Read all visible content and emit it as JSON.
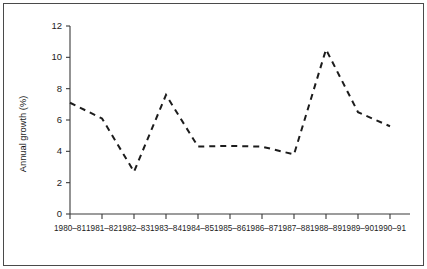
{
  "chart_data": {
    "type": "line",
    "title": "",
    "subtitle": "",
    "xlabel": "",
    "ylabel": "Annual growth (%)",
    "categories": [
      "1980–81",
      "1981–82",
      "1982–83",
      "1983–84",
      "1984–85",
      "1985–86",
      "1986–87",
      "1987–88",
      "1988–89",
      "1989–90",
      "1990–91"
    ],
    "values": [
      7.1,
      6.1,
      2.7,
      7.6,
      4.3,
      4.35,
      4.3,
      3.8,
      10.5,
      6.5,
      5.6
    ],
    "ylim": [
      0,
      12
    ],
    "yticks": [
      0,
      2,
      4,
      6,
      8,
      10,
      12
    ],
    "ytick_labels": [
      "0",
      "2",
      "4",
      "6",
      "8",
      "10",
      "12"
    ],
    "grid": false,
    "legend": null,
    "line_style": "dashed",
    "line_color": "#1c1c1c",
    "annotations": []
  },
  "figure": {
    "frame_color": "#4a4a4a",
    "background": "#ffffff",
    "axis_color": "#3a3a3a"
  }
}
